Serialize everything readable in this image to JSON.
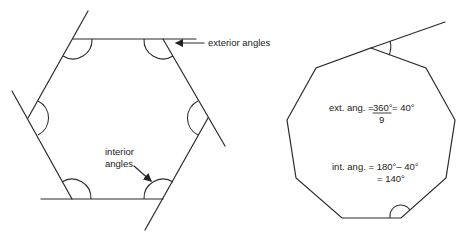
{
  "hexagon": {
    "labels": {
      "exterior": "exterior angles",
      "interior_line1": "interior",
      "interior_line2": "angles"
    },
    "vertices": [
      [
        73,
        39
      ],
      [
        163,
        39
      ],
      [
        208,
        118
      ],
      [
        163,
        199
      ],
      [
        72,
        199
      ],
      [
        28,
        118
      ]
    ]
  },
  "nonagon": {
    "sides": 9,
    "formulas": {
      "ext_prefix": "ext. ang. = ",
      "ext_numerator": "360°",
      "ext_denominator": "9",
      "ext_result": " = 40°",
      "int_line1": "int. ang. = 180°– 40°",
      "int_line2": "= 140°"
    },
    "vertices": [
      [
        371,
        48
      ],
      [
        426,
        68
      ],
      [
        455,
        120
      ],
      [
        446,
        178
      ],
      [
        401,
        218
      ],
      [
        342,
        218
      ],
      [
        296,
        178
      ],
      [
        287,
        120
      ],
      [
        316,
        68
      ]
    ]
  },
  "colors": {
    "stroke": "#2b2b2b",
    "text": "#222222",
    "background": "#ffffff"
  }
}
